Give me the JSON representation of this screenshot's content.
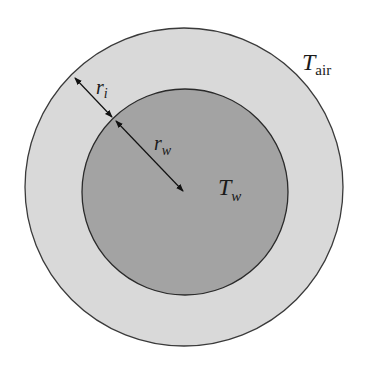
{
  "diagram": {
    "type": "concentric-circles",
    "outer_region": {
      "label_main": "T",
      "label_sub": "air",
      "fill": "#d9d9d9",
      "stroke": "#3a3a3a"
    },
    "inner_region": {
      "label_main": "T",
      "label_sub": "w",
      "fill": "#a3a3a3",
      "stroke": "#2a2a2a"
    },
    "dimensions": [
      {
        "label_main": "r",
        "label_sub": "i",
        "meaning": "thickness of outer layer"
      },
      {
        "label_main": "r",
        "label_sub": "w",
        "meaning": "radius of inner circle"
      }
    ]
  }
}
